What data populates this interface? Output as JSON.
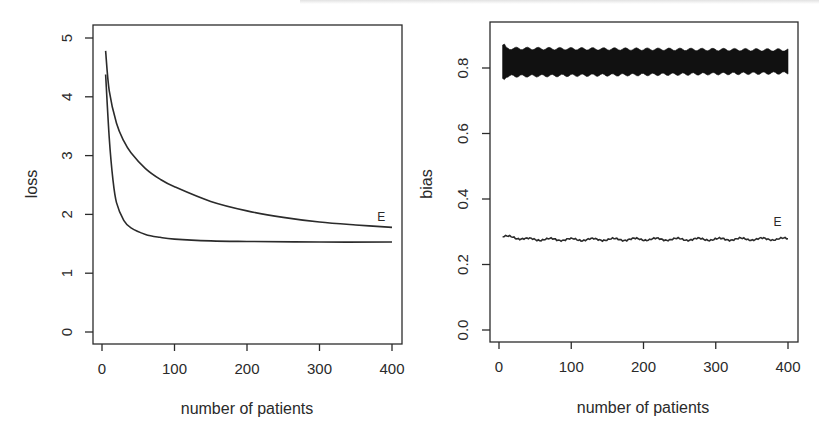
{
  "chart_data": [
    {
      "type": "line",
      "panel": "left",
      "title": "",
      "xlabel": "number of patients",
      "ylabel": "loss",
      "xlim": [
        0,
        400
      ],
      "ylim": [
        0,
        5
      ],
      "xticks": [
        "0",
        "100",
        "200",
        "300",
        "400"
      ],
      "yticks": [
        "0",
        "1",
        "2",
        "3",
        "4",
        "5"
      ],
      "grid": false,
      "annotations": [
        {
          "text": "E",
          "x": 395,
          "y": 1.95
        }
      ],
      "series": [
        {
          "name": "upper curve (E)",
          "x": [
            5,
            10,
            20,
            30,
            40,
            60,
            80,
            100,
            150,
            200,
            250,
            300,
            350,
            400
          ],
          "values": [
            4.78,
            4.1,
            3.55,
            3.25,
            3.05,
            2.78,
            2.6,
            2.47,
            2.22,
            2.06,
            1.95,
            1.87,
            1.82,
            1.78
          ]
        },
        {
          "name": "lower curve",
          "x": [
            5,
            10,
            15,
            20,
            30,
            40,
            60,
            80,
            100,
            150,
            200,
            300,
            400
          ],
          "values": [
            4.38,
            3.3,
            2.6,
            2.2,
            1.9,
            1.77,
            1.66,
            1.61,
            1.58,
            1.55,
            1.54,
            1.53,
            1.53
          ]
        }
      ]
    },
    {
      "type": "line",
      "panel": "right",
      "title": "",
      "xlabel": "number of patients",
      "ylabel": "bias",
      "xlim": [
        0,
        400
      ],
      "ylim": [
        0,
        0.9
      ],
      "xticks": [
        "0",
        "100",
        "200",
        "300",
        "400"
      ],
      "yticks": [
        "0.0",
        "0.2",
        "0.4",
        "0.6",
        "0.8"
      ],
      "grid": false,
      "annotations": [
        {
          "text": "E",
          "x": 395,
          "y": 0.3
        }
      ],
      "series": [
        {
          "name": "oscillating band",
          "x": [
            5,
            400
          ],
          "upper": [
            0.86,
            0.855
          ],
          "lower": [
            0.775,
            0.785
          ],
          "initial_spike": [
            0.87,
            0.765
          ]
        },
        {
          "name": "E (flat noisy)",
          "x": [
            5,
            20,
            40,
            100,
            200,
            300,
            400
          ],
          "values": [
            0.285,
            0.283,
            0.277,
            0.276,
            0.277,
            0.277,
            0.278
          ]
        }
      ]
    }
  ]
}
